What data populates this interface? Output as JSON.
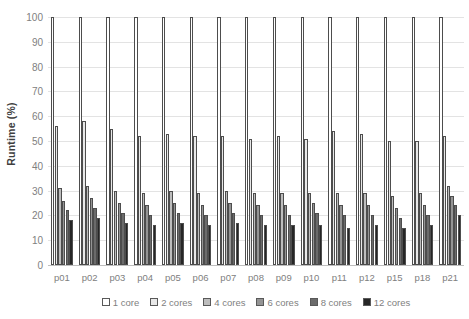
{
  "chart_data": {
    "type": "bar",
    "title": "",
    "xlabel": "",
    "ylabel": "Runtime (%)",
    "ylim": [
      0,
      100
    ],
    "ytick_labels": [
      "100",
      "90",
      "80",
      "70",
      "60",
      "50",
      "40",
      "30",
      "20",
      "10",
      "0"
    ],
    "yticks": [
      100,
      90,
      80,
      70,
      60,
      50,
      40,
      30,
      20,
      10,
      0
    ],
    "grid": true,
    "legend_position": "bottom",
    "categories": [
      "p01",
      "p02",
      "p03",
      "p04",
      "p05",
      "p06",
      "p07",
      "p08",
      "p09",
      "p10",
      "p11",
      "p12",
      "p15",
      "p18",
      "p21"
    ],
    "series": [
      {
        "name": "1 core",
        "color": "#ffffff",
        "values": [
          100,
          100,
          100,
          100,
          100,
          100,
          100,
          100,
          100,
          100,
          100,
          100,
          100,
          100,
          100
        ]
      },
      {
        "name": "2 cores",
        "color": "#e8e8e8",
        "values": [
          56,
          58,
          55,
          52,
          53,
          52,
          52,
          51,
          52,
          51,
          54,
          53,
          50,
          50,
          52
        ]
      },
      {
        "name": "4 cores",
        "color": "#bdbdbd",
        "values": [
          31,
          32,
          30,
          29,
          30,
          29,
          30,
          29,
          29,
          29,
          29,
          29,
          28,
          29,
          32
        ]
      },
      {
        "name": "6 cores",
        "color": "#949494",
        "values": [
          26,
          27,
          25,
          24,
          25,
          24,
          25,
          24,
          24,
          25,
          24,
          24,
          23,
          24,
          28
        ]
      },
      {
        "name": "8 cores",
        "color": "#6b6b6b",
        "values": [
          22,
          23,
          21,
          20,
          21,
          20,
          21,
          20,
          20,
          21,
          20,
          20,
          19,
          20,
          24
        ]
      },
      {
        "name": "12 cores",
        "color": "#262626",
        "values": [
          18,
          19,
          17,
          16,
          17,
          16,
          17,
          16,
          16,
          16,
          15,
          16,
          15,
          16,
          20
        ]
      }
    ]
  }
}
